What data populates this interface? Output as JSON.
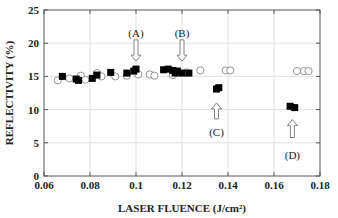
{
  "chart_data": {
    "type": "scatter",
    "title": "",
    "xlabel": "LASER FLUENCE  (J/cm²)",
    "ylabel": "REFLECTIVITY (%)",
    "xlim": [
      0.06,
      0.18
    ],
    "ylim": [
      0,
      25
    ],
    "xticks": [
      "0.06",
      "0.08",
      "0.1",
      "0.12",
      "0.14",
      "0.16",
      "0.18"
    ],
    "yticks": [
      "0",
      "5",
      "10",
      "15",
      "20",
      "25"
    ],
    "grid": true,
    "legend": null,
    "series": [
      {
        "name": "filled squares",
        "marker": "square-filled",
        "color": "#000000",
        "points": [
          [
            0.068,
            15.0
          ],
          [
            0.074,
            14.6
          ],
          [
            0.075,
            14.4
          ],
          [
            0.081,
            14.7
          ],
          [
            0.083,
            15.2
          ],
          [
            0.089,
            15.6
          ],
          [
            0.096,
            15.5
          ],
          [
            0.099,
            15.8
          ],
          [
            0.1,
            16.1
          ],
          [
            0.112,
            16.0
          ],
          [
            0.114,
            16.1
          ],
          [
            0.116,
            15.9
          ],
          [
            0.117,
            15.5
          ],
          [
            0.118,
            15.8
          ],
          [
            0.12,
            15.5
          ],
          [
            0.123,
            15.5
          ],
          [
            0.135,
            13.1
          ],
          [
            0.136,
            13.3
          ],
          [
            0.167,
            10.5
          ],
          [
            0.169,
            10.3
          ]
        ]
      },
      {
        "name": "open circles",
        "marker": "circle-open",
        "color": "#888888",
        "points": [
          [
            0.066,
            14.4
          ],
          [
            0.071,
            14.7
          ],
          [
            0.076,
            15.1
          ],
          [
            0.078,
            14.5
          ],
          [
            0.083,
            15.5
          ],
          [
            0.085,
            15.0
          ],
          [
            0.091,
            15.0
          ],
          [
            0.096,
            15.1
          ],
          [
            0.101,
            15.3
          ],
          [
            0.106,
            15.3
          ],
          [
            0.108,
            15.1
          ],
          [
            0.116,
            15.2
          ],
          [
            0.122,
            15.6
          ],
          [
            0.128,
            15.9
          ],
          [
            0.139,
            15.9
          ],
          [
            0.141,
            15.9
          ],
          [
            0.17,
            15.8
          ],
          [
            0.173,
            15.8
          ],
          [
            0.175,
            15.8
          ]
        ]
      }
    ],
    "annotations": [
      {
        "label": "(A)",
        "x": 0.1,
        "arrow": "down",
        "label_y": 21.6,
        "arrow_from": 20.5,
        "arrow_to": 17.3
      },
      {
        "label": "(B)",
        "x": 0.12,
        "arrow": "down",
        "label_y": 21.6,
        "arrow_from": 20.5,
        "arrow_to": 17.3
      },
      {
        "label": "(C)",
        "x": 0.135,
        "arrow": "up",
        "label_y": 6.6,
        "arrow_from": 8.6,
        "arrow_to": 11.0
      },
      {
        "label": "(D)",
        "x": 0.168,
        "arrow": "up",
        "label_y": 3.2,
        "arrow_from": 5.8,
        "arrow_to": 8.5
      }
    ]
  }
}
